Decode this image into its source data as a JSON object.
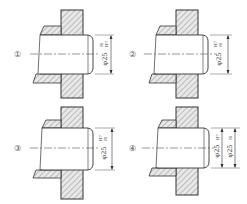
{
  "figure": {
    "panels": [
      {
        "id": "1",
        "marker": "①",
        "dims": [
          {
            "base": "φ25",
            "fit_top": "f6",
            "fit_bottom": "H7"
          }
        ]
      },
      {
        "id": "2",
        "marker": "②",
        "dims": [
          {
            "base": "φ25",
            "fit_top": "H7",
            "fit_bottom": "f6"
          }
        ]
      },
      {
        "id": "3",
        "marker": "③",
        "dims": [
          {
            "base": "φ25",
            "fit_top": "H7",
            "fit_bottom": "f6"
          }
        ]
      },
      {
        "id": "4",
        "marker": "④",
        "dims": [
          {
            "base": "φ25",
            "fit_top": "H7",
            "fit_bottom": ""
          },
          {
            "base": "φ25",
            "fit_top": "f6",
            "fit_bottom": ""
          }
        ]
      }
    ],
    "colors": {
      "line": "#333333",
      "hatch": "#777777",
      "fill": "#e6e6e6"
    }
  }
}
